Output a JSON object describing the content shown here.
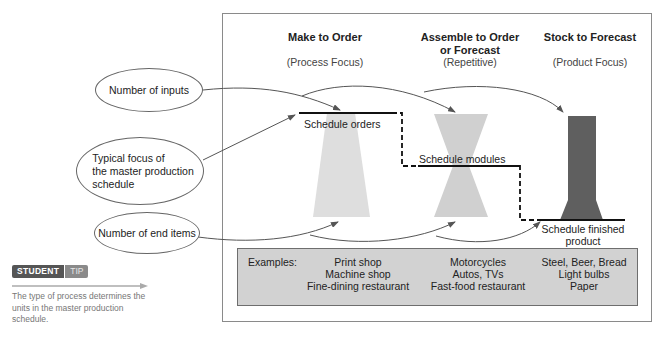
{
  "columns": [
    {
      "title": "Make to Order",
      "subtitle": "(Process Focus)"
    },
    {
      "title_line1": "Assemble to Order",
      "title_line2": "or Forecast",
      "subtitle": "(Repetitive)"
    },
    {
      "title": "Stock to Forecast",
      "subtitle": "(Product Focus)"
    }
  ],
  "callouts": {
    "inputs": "Number of inputs",
    "focus_line1": "Typical focus of",
    "focus_line2": "the master production",
    "focus_line3": "schedule",
    "end_items": "Number of end items"
  },
  "schedule_labels": {
    "orders": "Schedule orders",
    "modules": "Schedule modules",
    "finished_line1": "Schedule finished",
    "finished_line2": "product"
  },
  "examples": {
    "label": "Examples:",
    "make_to_order": [
      "Print shop",
      "Machine shop",
      "Fine-dining restaurant"
    ],
    "assemble_to_order": [
      "Motorcycles",
      "Autos, TVs",
      "Fast-food restaurant"
    ],
    "stock_to_forecast": [
      "Steel, Beer, Bread",
      "Light bulbs",
      "Paper"
    ]
  },
  "student_tip": {
    "badge_student": "STUDENT",
    "badge_tip": "TIP",
    "text": "The type of process determines the units in the master production schedule."
  },
  "colors": {
    "light_shape": "#dcdcdc",
    "mid_shape": "#d0d0d0",
    "dark_shape": "#5f5f5f",
    "examples_bg": "#d2d2d2",
    "line": "#555555"
  }
}
